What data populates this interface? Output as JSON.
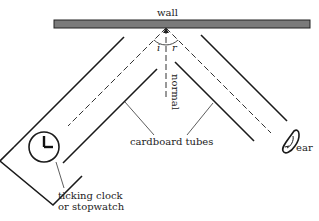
{
  "diagram": {
    "labels": {
      "wall": "wall",
      "incident_angle": "i",
      "reflected_angle": "r",
      "normal": "normal",
      "tubes": "cardboard tubes",
      "clock_line1": "ticking clock",
      "clock_line2": "or stopwatch",
      "ear": "ear"
    },
    "colors": {
      "wall_fill": "#7a7a7a",
      "line": "#1a1a1a"
    }
  }
}
